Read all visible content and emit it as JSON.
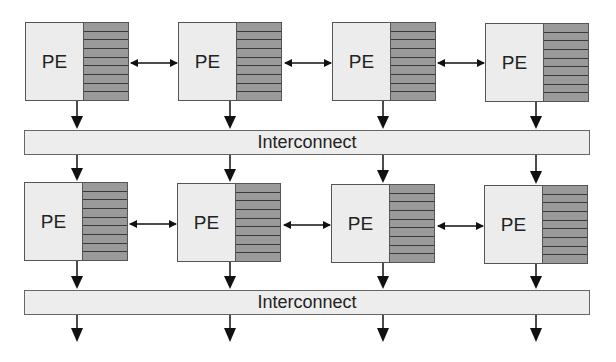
{
  "diagram": {
    "type": "processing-element-array",
    "rows": [
      {
        "elements": [
          {
            "label": "PE",
            "registers": 9
          },
          {
            "label": "PE",
            "registers": 9
          },
          {
            "label": "PE",
            "registers": 9
          },
          {
            "label": "PE",
            "registers": 9
          }
        ],
        "interconnect_label": "Interconnect"
      },
      {
        "elements": [
          {
            "label": "PE",
            "registers": 9
          },
          {
            "label": "PE",
            "registers": 9
          },
          {
            "label": "PE",
            "registers": 9
          },
          {
            "label": "PE",
            "registers": 9
          }
        ],
        "interconnect_label": "Interconnect"
      }
    ],
    "colors": {
      "pe_core": "#ececec",
      "registers": "#9a9a9a",
      "interconnect": "#ededed",
      "lines": "#111111"
    }
  }
}
